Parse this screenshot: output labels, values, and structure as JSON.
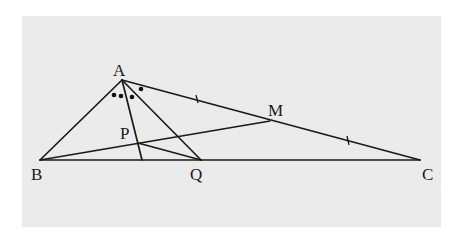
{
  "diagram": {
    "type": "geometry-triangle",
    "background_color": "#ebebeb",
    "line_color": "#1a1a1a",
    "points": {
      "A": {
        "label": "A",
        "x": 122,
        "y": 80
      },
      "B": {
        "label": "B",
        "x": 40,
        "y": 160
      },
      "C": {
        "label": "C",
        "x": 420,
        "y": 160
      },
      "M": {
        "label": "M",
        "x": 270,
        "y": 121
      },
      "P": {
        "label": "P",
        "x": 138,
        "y": 142
      },
      "Q": {
        "label": "Q",
        "x": 201,
        "y": 160
      }
    },
    "segments": [
      [
        "A",
        "B"
      ],
      [
        "A",
        "C"
      ],
      [
        "B",
        "C"
      ],
      [
        "A",
        "Q"
      ],
      [
        "B",
        "M"
      ],
      [
        "P",
        "Q"
      ],
      [
        "A",
        "foot"
      ]
    ],
    "annotations": {
      "equal_ticks": "AM = MC",
      "angle_marks": "three equal-angle dots at A plus one dot"
    }
  }
}
